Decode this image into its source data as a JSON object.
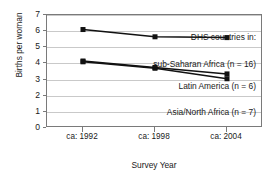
{
  "chart_data": {
    "type": "line",
    "title": "",
    "xlabel": "Survey Year",
    "ylabel": "Births per woman",
    "categories": [
      "ca: 1992",
      "ca: 1998",
      "ca: 2004"
    ],
    "ylim": [
      0,
      7
    ],
    "yticks": [
      0,
      1,
      2,
      3,
      4,
      5,
      6,
      7
    ],
    "ytick_labels": [
      "0",
      "1",
      "2",
      "3",
      "4",
      "5",
      "6",
      "7"
    ],
    "grid": true,
    "legend_position": "in-plot-right",
    "legend_header": "DHS countries in:",
    "series": [
      {
        "name": "sub-Saharan Africa (n = 16)",
        "values": [
          6.1,
          5.65,
          5.6
        ]
      },
      {
        "name": "Latin America (n = 6)",
        "values": [
          4.15,
          3.75,
          3.35
        ]
      },
      {
        "name": "Asia/North Africa (n = 7)",
        "values": [
          4.1,
          3.7,
          3.05
        ]
      }
    ],
    "annotations": [
      "DHS countries in:",
      "sub-Saharan Africa (n = 16)",
      "Latin America (n = 6)",
      "Asia/North Africa (n = 7)"
    ],
    "colors": {
      "line": "#111111",
      "marker": "#111111",
      "grid": "#c9c9c9",
      "axis": "#7a7a7a"
    }
  },
  "axes": {
    "y_title": "Births per woman",
    "x_title": "Survey Year",
    "y_ticks": [
      "7",
      "6",
      "5",
      "4",
      "3",
      "2",
      "1",
      "0"
    ],
    "x_ticks": [
      "ca: 1992",
      "ca: 1998",
      "ca: 2004"
    ]
  },
  "labels": {
    "header": "DHS countries in:",
    "sub_saharan": "sub-Saharan Africa (n = 16)",
    "latin_america": "Latin America (n = 6)",
    "asia_north_africa": "Asia/North Africa (n = 7)"
  }
}
